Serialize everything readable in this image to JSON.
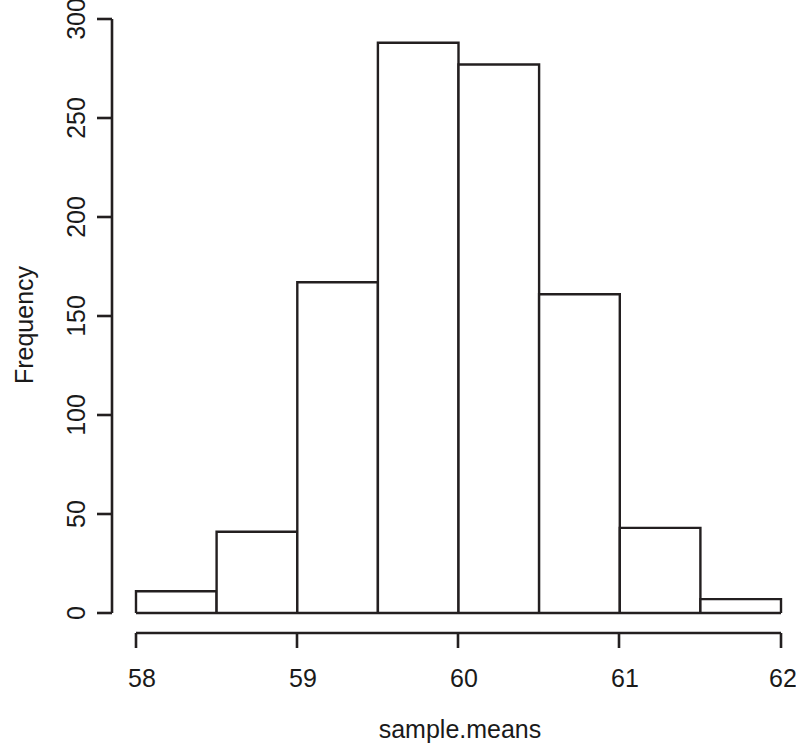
{
  "chart_data": {
    "type": "bar",
    "title": "",
    "subtitle": "",
    "xlabel": "sample.means",
    "ylabel": "Frequency",
    "xlim": [
      58,
      62
    ],
    "ylim": [
      0,
      300
    ],
    "grid": false,
    "legend": "none",
    "bin_width": 0.5,
    "bin_edges": [
      58,
      58.5,
      59,
      59.5,
      60,
      60.5,
      61,
      61.5,
      62
    ],
    "categories": [
      "58.0-58.5",
      "58.5-59.0",
      "59.0-59.5",
      "59.5-60.0",
      "60.0-60.5",
      "60.5-61.0",
      "61.0-61.5",
      "61.5-62.0"
    ],
    "values": [
      11,
      41,
      167,
      288,
      277,
      161,
      43,
      7
    ],
    "x_ticks": [
      58,
      59,
      60,
      61,
      62
    ],
    "x_tick_labels": [
      "58",
      "59",
      "60",
      "61",
      "62"
    ],
    "y_ticks": [
      0,
      50,
      100,
      150,
      200,
      250,
      300
    ],
    "y_tick_labels": [
      "0",
      "50",
      "100",
      "150",
      "200",
      "250",
      "300"
    ],
    "bar_fill": "#ffffff",
    "bar_stroke": "#231f20",
    "background": "#ffffff"
  },
  "axes": {
    "x": {
      "label": "sample.means",
      "tick_labels": [
        "58",
        "59",
        "60",
        "61",
        "62"
      ]
    },
    "y": {
      "label": "Frequency",
      "tick_labels": [
        "0",
        "50",
        "100",
        "150",
        "200",
        "250",
        "300"
      ]
    }
  }
}
